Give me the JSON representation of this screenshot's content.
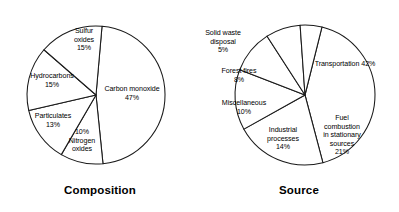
{
  "figure": {
    "background_color": "#ffffff",
    "line_color": "#1a1a1a",
    "text_color": "#000000"
  },
  "charts": [
    {
      "id": "composition",
      "title": "Composition",
      "title_y": 184,
      "center_x": 96,
      "center_y": 95,
      "radius": 69,
      "start_angle": -85,
      "slices": [
        {
          "name": "Carbon monoxide",
          "label": "Carbon monoxide\n47%",
          "value": 47,
          "label_x": 96,
          "label_y": 85,
          "label_w": 72,
          "label_align": "center"
        },
        {
          "name": "Nitrogen oxides",
          "label": "10%\nNitrogen\noxides",
          "value": 10,
          "label_x": 59,
          "label_y": 128,
          "label_w": 46,
          "label_align": "center"
        },
        {
          "name": "Particulates",
          "label": "Particulates\n13%",
          "value": 13,
          "label_x": 22,
          "label_y": 112,
          "label_w": 62,
          "label_align": "center"
        },
        {
          "name": "Hydrocarbons",
          "label": "Hydrocarbons\n15%",
          "value": 15,
          "label_x": 20,
          "label_y": 72,
          "label_w": 64,
          "label_align": "center"
        },
        {
          "name": "Sulfur oxides",
          "label": "Sulfur\noxides\n15%",
          "value": 15,
          "label_x": 62,
          "label_y": 27,
          "label_w": 44,
          "label_align": "center"
        }
      ]
    },
    {
      "id": "source",
      "title": "Source",
      "title_y": 184,
      "center_x": 106,
      "center_y": 95,
      "radius": 70,
      "start_angle": -76,
      "slices": [
        {
          "name": "Transportation",
          "label": "Transportation 42%",
          "value": 42,
          "label_x": 102,
          "label_y": 60,
          "label_w": 88,
          "label_align": "center"
        },
        {
          "name": "Fuel combustion in stationary sources",
          "label": "Fuel\ncombustion\nin stationary\nsources\n21%",
          "value": 21,
          "label_x": 113,
          "label_y": 114,
          "label_w": 60,
          "label_align": "center"
        },
        {
          "name": "Industrial processes",
          "label": "Industrial\nprocesses\n14%",
          "value": 14,
          "label_x": 58,
          "label_y": 126,
          "label_w": 52,
          "label_align": "center"
        },
        {
          "name": "Miscellaneous",
          "label": "Miscellaneous\n10%",
          "value": 10,
          "label_x": 12,
          "label_y": 99,
          "label_w": 66,
          "label_align": "center"
        },
        {
          "name": "Forest fires",
          "label": "Forest fires\n8%",
          "value": 8,
          "label_x": 11,
          "label_y": 67,
          "label_w": 58,
          "label_align": "center"
        },
        {
          "name": "Solid waste disposal",
          "label": "Solid waste\ndisposal\n5%",
          "value": 5,
          "label_x": -4,
          "label_y": 29,
          "label_w": 56,
          "label_align": "center"
        }
      ]
    }
  ],
  "chart_data": [
    {
      "type": "pie",
      "title": "Composition",
      "categories": [
        "Carbon monoxide",
        "Nitrogen oxides",
        "Particulates",
        "Hydrocarbons",
        "Sulfur oxides"
      ],
      "values": [
        47,
        10,
        13,
        15,
        15
      ],
      "unit": "percent",
      "labels": [
        "47%",
        "10%",
        "13%",
        "15%",
        "15%"
      ],
      "legend": "none",
      "grid": false,
      "xlabel": "",
      "ylabel": ""
    },
    {
      "type": "pie",
      "title": "Source",
      "categories": [
        "Transportation",
        "Fuel combustion in stationary sources",
        "Industrial processes",
        "Miscellaneous",
        "Forest fires",
        "Solid waste disposal"
      ],
      "values": [
        42,
        21,
        14,
        10,
        8,
        5
      ],
      "unit": "percent",
      "labels": [
        "42%",
        "21%",
        "14%",
        "10%",
        "8%",
        "5%"
      ],
      "legend": "none",
      "grid": false,
      "xlabel": "",
      "ylabel": ""
    }
  ]
}
